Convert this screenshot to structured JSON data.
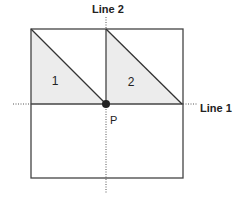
{
  "diagram": {
    "labels": {
      "line1": "Line 1",
      "line2": "Line 2",
      "point": "P",
      "triangle1": "1",
      "triangle2": "2"
    },
    "colors": {
      "stroke": "#333333",
      "fill": "#ececec",
      "dotted": "#555555",
      "point": "#222222"
    }
  }
}
